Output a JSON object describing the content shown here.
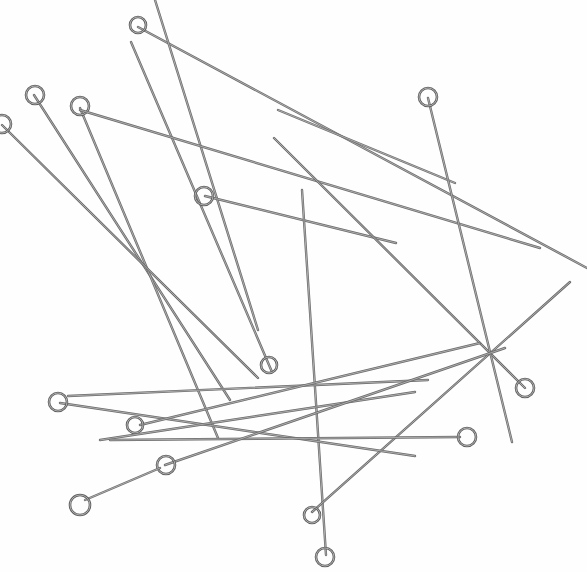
{
  "image": {
    "subject": "eye pins",
    "background_color": "#ffffff",
    "wire_color": "#6b6b6b",
    "pins": [
      {
        "x1": 138,
        "y1": 27,
        "x2": 587,
        "y2": 268,
        "eye": [
          138,
          25,
          8
        ]
      },
      {
        "x1": 131,
        "y1": 42,
        "x2": 272,
        "y2": 372,
        "eye": [
          269,
          365,
          8
        ]
      },
      {
        "x1": 155,
        "y1": 0,
        "x2": 258,
        "y2": 330
      },
      {
        "x1": 34,
        "y1": 95,
        "x2": 230,
        "y2": 400,
        "eye": [
          35,
          95,
          9
        ]
      },
      {
        "x1": 80,
        "y1": 108,
        "x2": 218,
        "y2": 438,
        "eye": [
          80,
          106,
          9
        ]
      },
      {
        "x1": 80,
        "y1": 110,
        "x2": 540,
        "y2": 248,
        "eye": []
      },
      {
        "x1": 2,
        "y1": 125,
        "x2": 258,
        "y2": 378,
        "eye": [
          2,
          124,
          9
        ]
      },
      {
        "x1": 205,
        "y1": 196,
        "x2": 396,
        "y2": 243,
        "eye": [
          204,
          196,
          9
        ]
      },
      {
        "x1": 278,
        "y1": 110,
        "x2": 455,
        "y2": 183
      },
      {
        "x1": 274,
        "y1": 138,
        "x2": 525,
        "y2": 388,
        "eye": [
          525,
          388,
          9
        ]
      },
      {
        "x1": 428,
        "y1": 98,
        "x2": 512,
        "y2": 442,
        "eye": [
          428,
          97,
          9
        ]
      },
      {
        "x1": 302,
        "y1": 190,
        "x2": 326,
        "y2": 555,
        "eye": [
          325,
          557,
          9
        ]
      },
      {
        "x1": 312,
        "y1": 512,
        "x2": 570,
        "y2": 282,
        "eye": [
          312,
          515,
          8
        ]
      },
      {
        "x1": 68,
        "y1": 396,
        "x2": 428,
        "y2": 380
      },
      {
        "x1": 60,
        "y1": 403,
        "x2": 415,
        "y2": 456,
        "eye": [
          58,
          402,
          9
        ]
      },
      {
        "x1": 140,
        "y1": 425,
        "x2": 480,
        "y2": 343,
        "eye": [
          135,
          425,
          8
        ]
      },
      {
        "x1": 100,
        "y1": 440,
        "x2": 415,
        "y2": 392
      },
      {
        "x1": 110,
        "y1": 440,
        "x2": 460,
        "y2": 437,
        "eye": [
          467,
          437,
          9
        ]
      },
      {
        "x1": 165,
        "y1": 465,
        "x2": 505,
        "y2": 348,
        "eye": [
          166,
          465,
          9
        ]
      },
      {
        "x1": 85,
        "y1": 500,
        "x2": 160,
        "y2": 468,
        "eye": [
          80,
          505,
          10
        ]
      }
    ]
  }
}
